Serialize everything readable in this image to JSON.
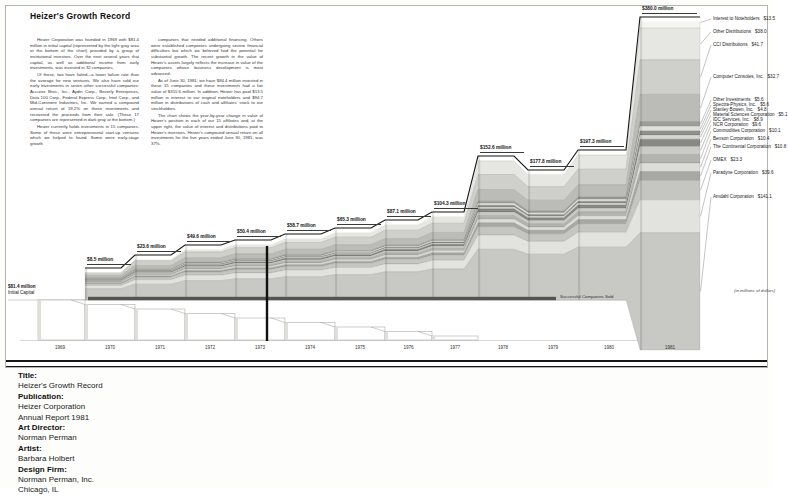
{
  "page": {
    "title": "Heizer's Growth Record"
  },
  "intro": {
    "col1": [
      "Heizer Corporation was founded in 1969 with $81.4 million in initial capital (represented by the light gray area at the bottom of the chart) provided by a group of institutional investors. Over the next several years that capital, as well as additional income from early investments, was invested in 32 companies.",
      "Of these, two have failed—a lower failure rate than the average for new ventures. We also have sold our early investments in seven other successful companies: Accurex Bros., Inc., Aydin Corp., Beverly Enterprises, Data 100 Corp., Federal Express Corp., Intel Corp., and Mid-Continent Industries, Inc. We earned a compound annual return of 19.2% on these investments and recovered the proceeds from their sale. (These 17 companies are represented in dark gray at the bottom.)",
      "Heizer currently holds investments in 15 companies. Some of these were entrepreneurial start-up ventures which we helped to found. Some were early-stage growth"
    ],
    "col2": [
      "companies that needed additional financing. Others were established companies undergoing severe financial difficulties but which we believed had the potential for substantial growth. The recent growth in the value of Heizer's assets largely reflects the increase in value of the companies whose business development is most advanced.",
      "As of June 30, 1981, we have $84.4 million invested in these 15 companies and these investments had a fair value of $315.6 million. In addition, Heizer has paid $13.5 million in interest to our original noteholders and $94.7 million in distributions of cash and affiliates' stock to our stockholders.",
      "The chart shows the year-by-year change in value of Heizer's position in each of our 15 affiliates and, at the upper right, the value of interest and distributions paid to Heizer's investors. Heizer's compound annual return on all investments for the five years ended June 30, 1981, was 37%."
    ]
  },
  "chart_data": {
    "type": "area",
    "subtype": "stepped-stacked-band",
    "title": "Heizer's Growth Record",
    "unit_note": "(in millions of dollars)",
    "x_range": [
      1969,
      1981
    ],
    "years": [
      1969,
      1970,
      1971,
      1972,
      1973,
      1974,
      1975,
      1976,
      1977,
      1978,
      1979,
      1980,
      1981
    ],
    "initial_capital_label": "$81.4 million",
    "initial_capital_sublabel": "Initial Capital",
    "sold_label": "Successful Companies Sold",
    "values": [
      8.5,
      23.6,
      49.6,
      50.4,
      58.7,
      65.3,
      87.1,
      104.3,
      152.6,
      177.8,
      197.3,
      380.0
    ],
    "milestones": [
      {
        "year": 1970,
        "label": "$8.5 million"
      },
      {
        "year": 1971,
        "label": "$23.6 million"
      },
      {
        "year": 1972,
        "label": "$49.6 million"
      },
      {
        "year": 1973,
        "label": "$50.4 million"
      },
      {
        "year": 1974,
        "label": "$58.7 million"
      },
      {
        "year": 1975,
        "label": "$65.3 million"
      },
      {
        "year": 1976,
        "label": "$87.1 million"
      },
      {
        "year": 1977,
        "label": "$104.3 million"
      },
      {
        "year": 1978,
        "label": "$152.6 million"
      },
      {
        "year": 1979,
        "label": "$177.8 million"
      },
      {
        "year": 1980,
        "label": "$197.3 million"
      },
      {
        "year": 1981,
        "label": "$380.0 million"
      }
    ],
    "legend": [
      {
        "name": "Interest to Noteholders",
        "amount": "$13.5",
        "value": 13.5
      },
      {
        "name": "Other Distributions",
        "amount": "$38.0",
        "value": 38.0
      },
      {
        "name": "CCI Distributions",
        "amount": "$41.7",
        "value": 41.7
      },
      {
        "name": "Computer Consoles, Inc.",
        "amount": "$32.7",
        "value": 32.7
      },
      {
        "name": "Other Investments",
        "amount": "$5.6",
        "value": 5.6
      },
      {
        "name": "Spectra-Physics, Inc.",
        "amount": "$5.6",
        "value": 5.6
      },
      {
        "name": "Stanley Bowen, Inc.",
        "amount": "$4.8",
        "value": 4.8
      },
      {
        "name": "Material Sciences Corporation",
        "amount": "$5.1",
        "value": 5.1
      },
      {
        "name": "IDC Services, Inc.",
        "amount": "$8.9",
        "value": 8.9
      },
      {
        "name": "NCR Corporation",
        "amount": "$9.6",
        "value": 9.6
      },
      {
        "name": "Commodities Corporation",
        "amount": "$10.1",
        "value": 10.1
      },
      {
        "name": "Benson Corporation",
        "amount": "$10.4",
        "value": 10.4
      },
      {
        "name": "The Continental Corporation",
        "amount": "$10.8",
        "value": 10.8
      },
      {
        "name": "OMEX",
        "amount": "$23.3",
        "value": 23.3
      },
      {
        "name": "Paradyne Corporation",
        "amount": "$39.6",
        "value": 39.6
      },
      {
        "name": "Amdahl Corporation",
        "amount": "$141.1",
        "value": 141.1
      }
    ],
    "colors": {
      "band_palette": [
        "#f4f4f0",
        "#e6e6e2",
        "#cfcfcb",
        "#bbbbb7",
        "#9d9d99",
        "#e0e0dc",
        "#90908c",
        "#d6d6d2",
        "#888884",
        "#cacac6",
        "#b3b3af",
        "#dcdcd8",
        "#a8a8a4",
        "#c5c5c1",
        "#e2e2de",
        "#c8c8c4"
      ],
      "outline": "#171715",
      "sold_band": "#55554f"
    }
  },
  "caption": {
    "rows": [
      {
        "label": "Title:",
        "values": [
          "Heizer's Growth Record"
        ]
      },
      {
        "label": "Publication:",
        "values": [
          "Heizer Corporation",
          "Annual Report 1981"
        ]
      },
      {
        "label": "Art Director:",
        "values": [
          "Norman Perman"
        ]
      },
      {
        "label": "Artist:",
        "values": [
          "Barbara Holbert"
        ]
      },
      {
        "label": "Design Firm:",
        "values": [
          "Norman Perman, Inc.",
          "Chicago, IL"
        ]
      }
    ]
  }
}
